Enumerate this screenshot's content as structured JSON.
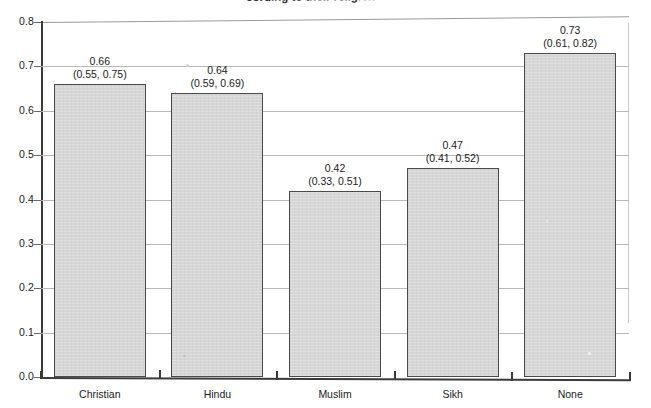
{
  "title": {
    "visible_fragment": "cording to their religion",
    "note_clipped": "top of title cropped by screenshot edge"
  },
  "chart_data": {
    "type": "bar",
    "title": "cording to their religion",
    "xlabel": "",
    "ylabel": "",
    "categories": [
      "Christian",
      "Hindu",
      "Muslim",
      "Sikh",
      "None"
    ],
    "values": [
      0.66,
      0.64,
      0.42,
      0.47,
      0.73
    ],
    "value_labels": [
      "0.66",
      "0.64",
      "0.42",
      "0.47",
      "0.73"
    ],
    "ci_lower": [
      0.55,
      0.59,
      0.33,
      0.41,
      0.61
    ],
    "ci_upper": [
      0.75,
      0.69,
      0.51,
      0.52,
      0.82
    ],
    "ci_labels": [
      "(0.55, 0.75)",
      "(0.59, 0.69)",
      "(0.33, 0.51)",
      "(0.41, 0.52)",
      "(0.61, 0.82)"
    ],
    "ylim": [
      0.0,
      0.8
    ],
    "yticks": [
      "0.0",
      "0.1",
      "0.2",
      "0.3",
      "0.4",
      "0.5",
      "0.6",
      "0.7",
      "0.8"
    ],
    "ytick_values": [
      0.0,
      0.1,
      0.2,
      0.3,
      0.4,
      0.5,
      0.6,
      0.7,
      0.8
    ],
    "grid": true,
    "legend": "none",
    "bar_fill_color": "#d6d6d6",
    "bar_edge_color": "#4a4a4a",
    "grid_color": "#b9b9b9",
    "axis_color": "#3a3a3a",
    "background_color": "#ffffff"
  }
}
